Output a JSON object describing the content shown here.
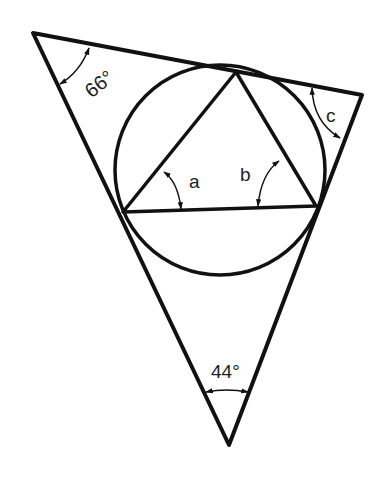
{
  "diagram": {
    "outer_triangle": {
      "vertices": {
        "top_left": [
          33,
          33
        ],
        "right": [
          362,
          95
        ],
        "bottom": [
          229,
          445
        ]
      }
    },
    "incircle": {
      "center": [
        220,
        170
      ],
      "radius": 105
    },
    "inner_triangle": {
      "vertices": {
        "top": [
          236,
          72
        ],
        "left": [
          123,
          212
        ],
        "right": [
          316,
          206
        ]
      }
    },
    "angles": {
      "top_left": {
        "label": "66°",
        "value": 66
      },
      "bottom": {
        "label": "44°",
        "value": 44
      },
      "right": {
        "label": "c",
        "value": null
      },
      "inner_left": {
        "label": "a",
        "value": null
      },
      "inner_right": {
        "label": "b",
        "value": null
      }
    }
  },
  "colors": {
    "stroke": "#111111",
    "background": "#ffffff",
    "text": "#222222"
  }
}
